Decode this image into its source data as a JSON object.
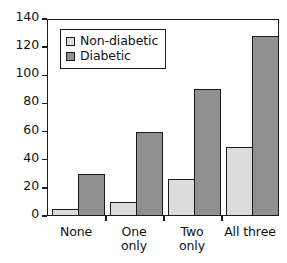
{
  "chart_data": {
    "type": "bar",
    "title": "",
    "xlabel": "",
    "ylabel": "",
    "categories": [
      "None",
      "One\nonly",
      "Two\nonly",
      "All three"
    ],
    "series": [
      {
        "name": "Non-diabetic",
        "color": "#dcdcdc",
        "values": [
          5,
          10,
          26,
          49
        ]
      },
      {
        "name": "Diabetic",
        "color": "#909090",
        "values": [
          30,
          60,
          90,
          128
        ]
      }
    ],
    "ylim": [
      0,
      140
    ],
    "yticks": [
      0,
      20,
      40,
      60,
      80,
      100,
      120,
      140
    ],
    "ytick_labels": [
      "0",
      "20",
      "40",
      "60",
      "80",
      "100",
      "120",
      "140"
    ],
    "grid": false,
    "legend_position": "upper left",
    "frame_color": "#1a1a1a"
  }
}
